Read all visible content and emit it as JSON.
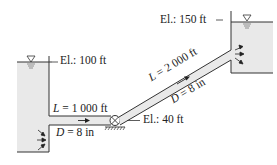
{
  "left_reservoir": {
    "elevation_label": "El.: 100 ft"
  },
  "right_reservoir": {
    "elevation_label": "El.: 150 ft"
  },
  "pipe_1": {
    "length_symbol": "L",
    "length_value": " = 1 000 ft",
    "diameter_symbol": "D",
    "diameter_value": " = 8 in"
  },
  "pipe_2": {
    "length_symbol": "L",
    "length_value": " = 2 000 ft",
    "diameter_symbol": "D",
    "diameter_value": " = 8 in"
  },
  "pump": {
    "elevation_label": "El.: 40 ft"
  },
  "colors": {
    "water": "#e8e8e8",
    "line": "#333333"
  }
}
